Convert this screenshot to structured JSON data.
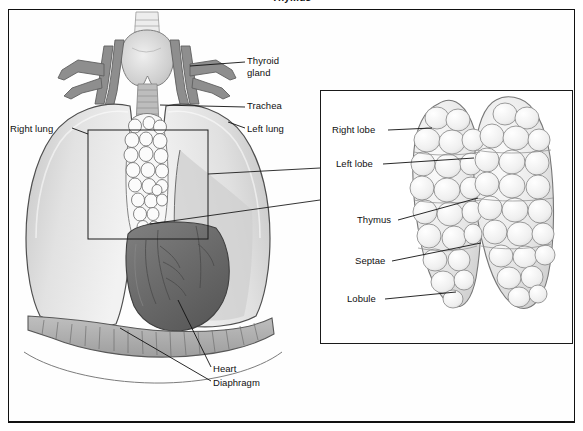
{
  "figure": {
    "title": "Thymus",
    "background_color": "#ffffff",
    "frame_color": "#111111"
  },
  "main_illustration": {
    "name": "thorax-anterior-view",
    "labels": {
      "right_lung": "Right lung",
      "left_lung": "Left lung",
      "thyroid_gland": "Thyroid\ngland",
      "trachea": "Trachea",
      "heart": "Heart",
      "diaphragm": "Diaphragm"
    },
    "colors": {
      "lung_fill": "#d8d8d8",
      "lung_highlight": "#f0f0f0",
      "lung_outline": "#4a4a4a",
      "vessel_fill": "#8c8c8c",
      "vessel_outline": "#5a5a5a",
      "thyroid_fill": "#c9c9c9",
      "trachea_fill": "#b5b5b5",
      "thymus_fill": "#fafafa",
      "thymus_outline": "#6a6a6a",
      "heart_fill": "#6f6f6f",
      "heart_outline": "#3d3d3d",
      "diaphragm_fill": "#aeaeae"
    }
  },
  "callout": {
    "name": "thymus-magnification-box",
    "rect": {
      "x": 88,
      "y": 130,
      "width": 120,
      "height": 109
    }
  },
  "inset_panel": {
    "name": "thymus-detail",
    "labels": {
      "right_lobe": "Right lobe",
      "left_lobe": "Left lobe",
      "thymus": "Thymus",
      "septae": "Septae",
      "lobule": "Lobule"
    },
    "colors": {
      "lobe_fill": "#ececec",
      "lobe_shadow": "#cfcfcf",
      "lobe_outline": "#7a7a7a",
      "border": "#1a1a1a"
    }
  }
}
